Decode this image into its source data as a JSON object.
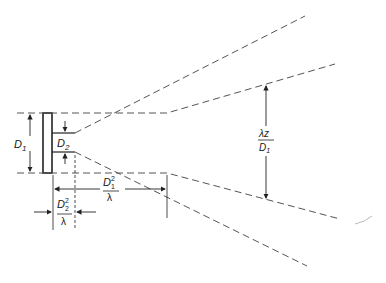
{
  "diagram": {
    "type": "optics-beam-divergence",
    "labels": {
      "d1": {
        "main": "D",
        "sub": "1"
      },
      "d2": {
        "main": "D",
        "sub": "2"
      },
      "d1_sq_over_lambda": {
        "num_main": "D",
        "num_sup": "2",
        "num_sub": "1",
        "den": "λ"
      },
      "d2_sq_over_lambda": {
        "num_main": "D",
        "num_sup": "2",
        "num_sub": "2",
        "den": "λ"
      },
      "lambda_z_over_d1": {
        "num": "λz",
        "den_main": "D",
        "den_sub": "1"
      }
    },
    "colors": {
      "line": "#2a2a2a",
      "dash": "#555555",
      "background": "#ffffff"
    }
  }
}
